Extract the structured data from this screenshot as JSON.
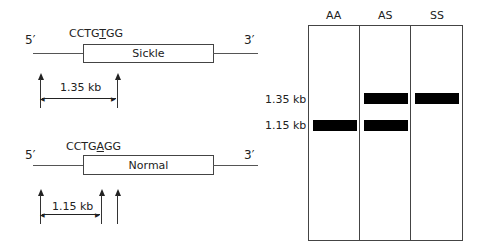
{
  "sickle": {
    "five_prime": "5′",
    "three_prime": "3′",
    "seq_pre": "CCTG",
    "seq_mut": "T",
    "seq_post": "GG",
    "gene_label": "Sickle",
    "fragment": "1.35 kb"
  },
  "normal": {
    "five_prime": "5′",
    "three_prime": "3′",
    "seq_pre": "CCTG",
    "seq_mut": "A",
    "seq_post": "GG",
    "gene_label": "Normal",
    "fragment": "1.15 kb"
  },
  "gel": {
    "lanes": [
      "AA",
      "AS",
      "SS"
    ],
    "size_labels": [
      "1.35 kb",
      "1.15 kb"
    ],
    "bands": {
      "AA": [
        "1.15 kb"
      ],
      "AS": [
        "1.35 kb",
        "1.15 kb"
      ],
      "SS": [
        "1.35 kb"
      ]
    }
  }
}
